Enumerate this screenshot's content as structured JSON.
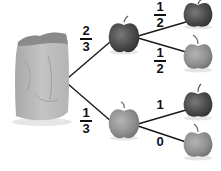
{
  "diagram": {
    "type": "probability-tree",
    "root": {
      "label": "bag"
    },
    "level1": [
      {
        "outcome": "dark apple",
        "probability": {
          "num": "2",
          "den": "3"
        }
      },
      {
        "outcome": "light apple",
        "probability": {
          "num": "1",
          "den": "3"
        }
      }
    ],
    "level2": [
      {
        "parent": "dark apple",
        "outcome": "dark apple",
        "probability": {
          "num": "1",
          "den": "2"
        }
      },
      {
        "parent": "dark apple",
        "outcome": "light apple",
        "probability": {
          "num": "1",
          "den": "2"
        }
      },
      {
        "parent": "light apple",
        "outcome": "dark apple",
        "probability": {
          "value": "1"
        }
      },
      {
        "parent": "light apple",
        "outcome": "light apple",
        "probability": {
          "value": "0"
        }
      }
    ],
    "colors": {
      "dark_apple": "#4a4a4a",
      "light_apple": "#8e8e8e",
      "bag": "#b9b9b9",
      "line": "#1a1a1a"
    }
  }
}
